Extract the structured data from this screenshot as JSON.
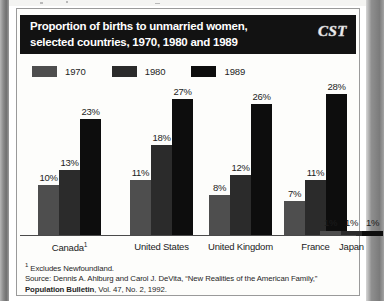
{
  "figure": {
    "title_line1": "Proportion of births to unmarried women,",
    "title_line2": "selected countries, 1970, 1980 and 1989",
    "logo_text": "CST",
    "footnote_marker": "1",
    "footnote_text": " Excludes Newfoundland.",
    "source_prefix": "Source: Dennis A. Ahlburg and Carol J. DeVita, “New Realities of the American Family,” ",
    "source_publication": "Population Bulletin",
    "source_suffix": ", Vol. 47, No. 2, 1992."
  },
  "colors": {
    "series_1970": "#4e4e4e",
    "series_1980": "#2b2b2b",
    "series_1989": "#0d0d0d",
    "title_bar": "#121212",
    "panel_bg": "#fdfdfb",
    "axis": "#4a4a4a"
  },
  "chart_data": {
    "type": "bar",
    "title": "Proportion of births to unmarried women, selected countries, 1970, 1980 and 1989",
    "xlabel": "",
    "ylabel": "",
    "ylim": [
      0,
      30
    ],
    "grid": false,
    "legend_position": "top-left",
    "value_suffix": "%",
    "categories": [
      "Canada¹",
      "United States",
      "United Kingdom",
      "France",
      "Japan"
    ],
    "legend": [
      "1970",
      "1980",
      "1989"
    ],
    "series": [
      {
        "name": "1970",
        "values": [
          10,
          11,
          8,
          7,
          1
        ],
        "labels": [
          "10%",
          "11%",
          "8%",
          "7%",
          "1%"
        ]
      },
      {
        "name": "1980",
        "values": [
          13,
          18,
          12,
          11,
          1
        ],
        "labels": [
          "13%",
          "18%",
          "12%",
          "11%",
          "1%"
        ]
      },
      {
        "name": "1989",
        "values": [
          23,
          27,
          26,
          28,
          1
        ],
        "labels": [
          "23%",
          "27%",
          "26%",
          "28%",
          "1%"
        ]
      }
    ],
    "annotations": [
      "¹ Excludes Newfoundland.",
      "Source: Dennis A. Ahlburg and Carol J. DeVita, “New Realities of the American Family,” Population Bulletin, Vol. 47, No. 2, 1992."
    ]
  }
}
